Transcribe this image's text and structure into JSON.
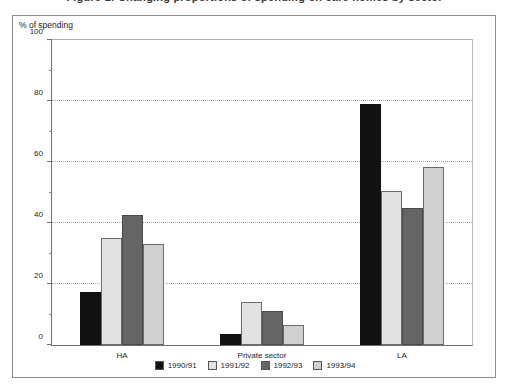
{
  "figure": {
    "title": "Figure 1: Changing proportions of spending on care homes by sector"
  },
  "chart_data": {
    "type": "bar",
    "title": "",
    "axis_caption": "% of spending",
    "xlabel": "",
    "ylabel": "% of spending",
    "ylim": [
      0,
      100
    ],
    "yticks": [
      0,
      20,
      40,
      60,
      80,
      100
    ],
    "ytick_labels": [
      "0",
      "20",
      "40",
      "60",
      "80",
      "100"
    ],
    "minor_yticks": [
      10,
      30,
      50,
      70,
      90
    ],
    "grid": true,
    "grid_axis": "y",
    "legend_position": "bottom",
    "categories": [
      "HA",
      "Private sector",
      "LA"
    ],
    "series": [
      {
        "name": "1990/91",
        "color": "#121212",
        "values": [
          17.5,
          3.5,
          79.0
        ]
      },
      {
        "name": "1991/92",
        "color": "#e2e2e2",
        "values": [
          35.0,
          14.0,
          50.5
        ]
      },
      {
        "name": "1992/93",
        "color": "#656565",
        "values": [
          42.5,
          11.0,
          45.0
        ]
      },
      {
        "name": "1993/94",
        "color": "#d0d0d0",
        "values": [
          33.0,
          6.5,
          58.5
        ]
      }
    ]
  }
}
